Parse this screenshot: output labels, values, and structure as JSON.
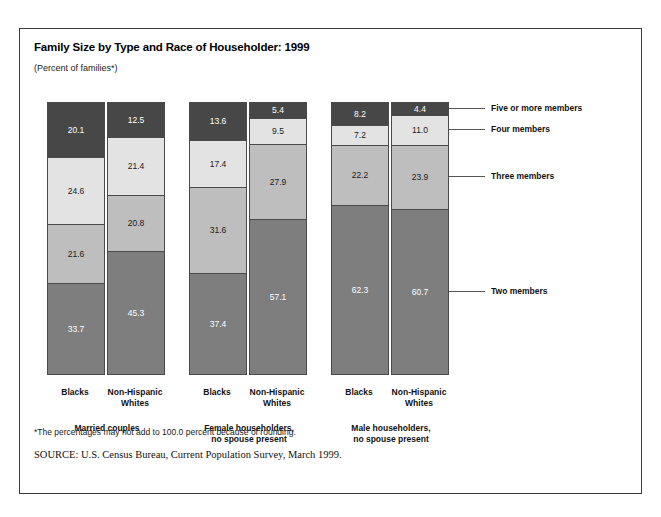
{
  "title": "Family Size by Type and Race of Householder: 1999",
  "subtitle": "(Percent of families*)",
  "footnote": "*The percentages may not add to 100.0 percent because of rounding.",
  "source": {
    "label": "SOURCE:",
    "text": "U.S. Census Bureau, Current Population Survey, March 1999."
  },
  "legend": [
    {
      "label": "Five or more members",
      "color": "#474747"
    },
    {
      "label": "Four members",
      "color": "#e3e3e3"
    },
    {
      "label": "Three members",
      "color": "#bebebe"
    },
    {
      "label": "Two members",
      "color": "#7e7e7e"
    }
  ],
  "groups": [
    {
      "label": "Married couples"
    },
    {
      "label": "Female householders,\nno spouse present"
    },
    {
      "label": "Male householders,\nno spouse present"
    }
  ],
  "bars": [
    {
      "group": "Married couples",
      "race": "Blacks",
      "label_line1": "Blacks",
      "label_line2": ""
    },
    {
      "group": "Married couples",
      "race": "Non-Hispanic Whites",
      "label_line1": "Non-Hispanic",
      "label_line2": "Whites"
    },
    {
      "group": "Female householders, no spouse present",
      "race": "Blacks",
      "label_line1": "Blacks",
      "label_line2": ""
    },
    {
      "group": "Female householders, no spouse present",
      "race": "Non-Hispanic Whites",
      "label_line1": "Non-Hispanic",
      "label_line2": "Whites"
    },
    {
      "group": "Male householders, no spouse present",
      "race": "Blacks",
      "label_line1": "Blacks",
      "label_line2": ""
    },
    {
      "group": "Male householders, no spouse present",
      "race": "Non-Hispanic Whites",
      "label_line1": "Non-Hispanic",
      "label_line2": "Whites"
    }
  ],
  "chart_data": {
    "type": "bar",
    "subtype": "stacked-vertical-100",
    "title": "Family Size by Type and Race of Householder: 1999",
    "subtitle": "(Percent of families*)",
    "xlabel": "",
    "ylabel": "Percent of families",
    "ylim": [
      0,
      100
    ],
    "grid": false,
    "legend_position": "right-leader-lines",
    "categories": [
      "Married couples — Blacks",
      "Married couples — Non-Hispanic Whites",
      "Female householders, no spouse present — Blacks",
      "Female householders, no spouse present — Non-Hispanic Whites",
      "Male householders, no spouse present — Blacks",
      "Male householders, no spouse present — Non-Hispanic Whites"
    ],
    "series": [
      {
        "name": "Two members",
        "color": "#7e7e7e",
        "values": [
          33.7,
          45.3,
          37.4,
          57.1,
          62.3,
          60.7
        ]
      },
      {
        "name": "Three members",
        "color": "#bebebe",
        "values": [
          21.6,
          20.8,
          31.6,
          27.9,
          22.2,
          23.9
        ]
      },
      {
        "name": "Four members",
        "color": "#e3e3e3",
        "values": [
          24.6,
          21.4,
          17.4,
          9.5,
          7.2,
          11.0
        ]
      },
      {
        "name": "Five or more members",
        "color": "#474747",
        "values": [
          20.1,
          12.5,
          13.6,
          5.4,
          8.2,
          4.4
        ]
      }
    ],
    "stack_order_top_to_bottom": [
      "Five or more members",
      "Four members",
      "Three members",
      "Two members"
    ],
    "value_labels": [
      {
        "category": "Married couples — Blacks",
        "five_or_more": 20.1,
        "four": 24.6,
        "three": 21.6,
        "two": 33.7
      },
      {
        "category": "Married couples — Non-Hispanic Whites",
        "five_or_more": 12.5,
        "four": 21.4,
        "three": 20.8,
        "two": 45.3
      },
      {
        "category": "Female householders, no spouse present — Blacks",
        "five_or_more": 13.6,
        "four": 17.4,
        "three": 31.6,
        "two": 37.4
      },
      {
        "category": "Female householders, no spouse present — Non-Hispanic Whites",
        "five_or_more": 5.4,
        "four": 9.5,
        "three": 27.9,
        "two": 57.1
      },
      {
        "category": "Male householders, no spouse present — Blacks",
        "five_or_more": 8.2,
        "four": 7.2,
        "three": 22.2,
        "two": 62.3
      },
      {
        "category": "Male householders, no spouse present — Non-Hispanic Whites",
        "five_or_more": 4.4,
        "four": 11.0,
        "three": 23.9,
        "two": 60.7
      }
    ]
  }
}
